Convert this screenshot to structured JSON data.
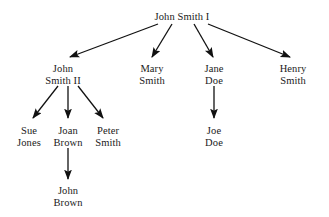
{
  "diagram": {
    "type": "family-tree",
    "canvas": {
      "width": 329,
      "height": 217
    },
    "colors": {
      "background": "#ffffff",
      "text": "#1a1a1a",
      "edge": "#111111"
    },
    "nodes": [
      {
        "id": "john1",
        "name": "john-smith-i-node",
        "line1": "John Smith I",
        "line2": "",
        "x": 182,
        "y": 11
      },
      {
        "id": "john2",
        "name": "john-smith-ii-node",
        "line1": "John",
        "line2": "Smith II",
        "x": 63,
        "y": 63
      },
      {
        "id": "mary",
        "name": "mary-smith-node",
        "line1": "Mary",
        "line2": "Smith",
        "x": 152,
        "y": 63
      },
      {
        "id": "jane",
        "name": "jane-doe-node",
        "line1": "Jane",
        "line2": "Doe",
        "x": 214,
        "y": 63
      },
      {
        "id": "henry",
        "name": "henry-smith-node",
        "line1": "Henry",
        "line2": "Smith",
        "x": 293,
        "y": 63
      },
      {
        "id": "sue",
        "name": "sue-jones-node",
        "line1": "Sue",
        "line2": "Jones",
        "x": 29,
        "y": 125
      },
      {
        "id": "joan",
        "name": "joan-brown-node",
        "line1": "Joan",
        "line2": "Brown",
        "x": 68,
        "y": 125
      },
      {
        "id": "peter",
        "name": "peter-smith-node",
        "line1": "Peter",
        "line2": "Smith",
        "x": 108,
        "y": 125
      },
      {
        "id": "joe",
        "name": "joe-doe-node",
        "line1": "Joe",
        "line2": "Doe",
        "x": 214,
        "y": 125
      },
      {
        "id": "johnb",
        "name": "john-brown-node",
        "line1": "John",
        "line2": "Brown",
        "x": 68,
        "y": 185
      }
    ],
    "edges": [
      {
        "name": "edge-john1-to-john2",
        "from": "john1",
        "to": "john2",
        "x1": 158,
        "y1": 24,
        "x2": 70,
        "y2": 57
      },
      {
        "name": "edge-john1-to-mary",
        "from": "john1",
        "to": "mary",
        "x1": 172,
        "y1": 24,
        "x2": 152,
        "y2": 57
      },
      {
        "name": "edge-john1-to-jane",
        "from": "john1",
        "to": "jane",
        "x1": 194,
        "y1": 24,
        "x2": 213,
        "y2": 57
      },
      {
        "name": "edge-john1-to-henry",
        "from": "john1",
        "to": "henry",
        "x1": 208,
        "y1": 24,
        "x2": 290,
        "y2": 57
      },
      {
        "name": "edge-john2-to-sue",
        "from": "john2",
        "to": "sue",
        "x1": 58,
        "y1": 86,
        "x2": 33,
        "y2": 118
      },
      {
        "name": "edge-john2-to-joan",
        "from": "john2",
        "to": "joan",
        "x1": 68,
        "y1": 86,
        "x2": 68,
        "y2": 118
      },
      {
        "name": "edge-john2-to-peter",
        "from": "john2",
        "to": "peter",
        "x1": 78,
        "y1": 86,
        "x2": 103,
        "y2": 118
      },
      {
        "name": "edge-jane-to-joe",
        "from": "jane",
        "to": "joe",
        "x1": 214,
        "y1": 86,
        "x2": 214,
        "y2": 118
      },
      {
        "name": "edge-joan-to-johnb",
        "from": "joan",
        "to": "johnb",
        "x1": 68,
        "y1": 148,
        "x2": 68,
        "y2": 179
      }
    ]
  }
}
